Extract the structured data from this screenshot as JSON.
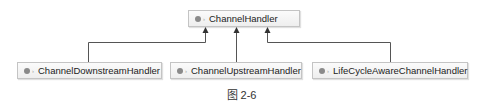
{
  "diagram": {
    "type": "class-hierarchy",
    "root": {
      "label": "ChannelHandler",
      "icon": "interface-icon"
    },
    "children": [
      {
        "label": "ChannelDownstreamHandler",
        "icon": "interface-icon"
      },
      {
        "label": "ChannelUpstreamHandler",
        "icon": "interface-icon"
      },
      {
        "label": "LifeCycleAwareChannelHandler",
        "icon": "interface-icon"
      }
    ],
    "edges": [
      {
        "from": "ChannelDownstreamHandler",
        "to": "ChannelHandler",
        "kind": "extends"
      },
      {
        "from": "ChannelUpstreamHandler",
        "to": "ChannelHandler",
        "kind": "extends"
      },
      {
        "from": "LifeCycleAwareChannelHandler",
        "to": "ChannelHandler",
        "kind": "extends"
      }
    ],
    "caption": "图 2-6",
    "colors": {
      "node_border": "#c4c4c4",
      "node_fill": "#f4f4f4",
      "line": "#555555",
      "icon": "#8a8a8a"
    }
  }
}
